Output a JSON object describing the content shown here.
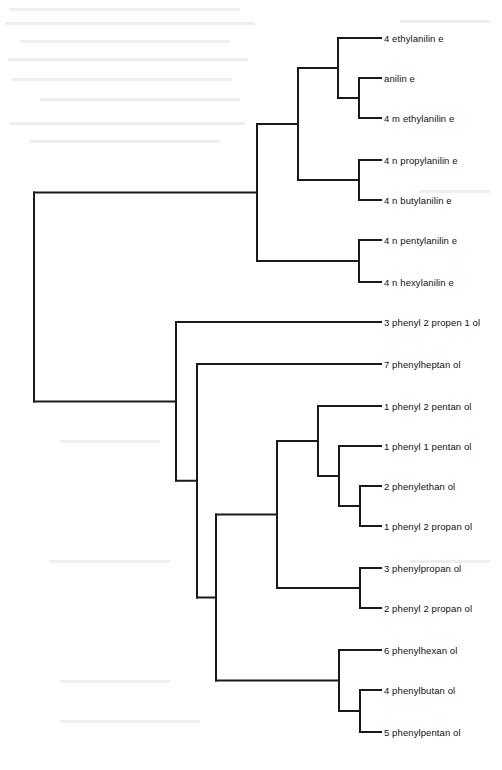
{
  "diagram": {
    "type": "dendrogram",
    "orientation": "left-to-right",
    "line_color": "#1a1a1a",
    "background": "#ffffff",
    "leaf_x_end": 381,
    "label_x": 384,
    "leaves": [
      {
        "id": "L0",
        "label": "4 ethylanilin e",
        "y": 38
      },
      {
        "id": "L1",
        "label": "anilin e",
        "y": 78
      },
      {
        "id": "L2",
        "label": "4 m ethylanilin e",
        "y": 118
      },
      {
        "id": "L3",
        "label": "4 n  propylanilin e",
        "y": 160
      },
      {
        "id": "L4",
        "label": "4 n  butylanilin e",
        "y": 200
      },
      {
        "id": "L5",
        "label": "4 n  pentylanilin e",
        "y": 240
      },
      {
        "id": "L6",
        "label": "4 n  hexylanilin e",
        "y": 282
      },
      {
        "id": "L7",
        "label": "3 phenyl 2 propen  1 ol",
        "y": 322
      },
      {
        "id": "L8",
        "label": "7 phenylheptan ol",
        "y": 364
      },
      {
        "id": "L9",
        "label": "1 phenyl 2 pentan ol",
        "y": 406
      },
      {
        "id": "L10",
        "label": "1 phenyl 1 pentan ol",
        "y": 446
      },
      {
        "id": "L11",
        "label": "2 phenylethan ol",
        "y": 486
      },
      {
        "id": "L12",
        "label": "1 phenyl 2 propan ol",
        "y": 526
      },
      {
        "id": "L13",
        "label": "3 phenylpropan ol",
        "y": 568
      },
      {
        "id": "L14",
        "label": "2 phenyl 2 propan ol",
        "y": 608
      },
      {
        "id": "L15",
        "label": "6 phenylhexan ol",
        "y": 650
      },
      {
        "id": "L16",
        "label": "4 phenylbutan ol",
        "y": 690
      },
      {
        "id": "L17",
        "label": "5 phenylpentan ol",
        "y": 732
      }
    ],
    "nodes": [
      {
        "id": "N_anil_methyl",
        "x": 359,
        "children": [
          "L1",
          "L2"
        ]
      },
      {
        "id": "N_ethyl_group",
        "x": 338,
        "children": [
          "L0",
          "N_anil_methyl"
        ]
      },
      {
        "id": "N_prop_but",
        "x": 359,
        "children": [
          "L3",
          "L4"
        ]
      },
      {
        "id": "N_aniline_top",
        "x": 298,
        "children": [
          "N_ethyl_group",
          "N_prop_but"
        ]
      },
      {
        "id": "N_pent_hex",
        "x": 359,
        "children": [
          "L5",
          "L6"
        ]
      },
      {
        "id": "N_anilines",
        "x": 257,
        "children": [
          "N_aniline_top",
          "N_pent_hex"
        ]
      },
      {
        "id": "N_eth_prop",
        "x": 360,
        "children": [
          "L11",
          "L12"
        ]
      },
      {
        "id": "N_1p1p",
        "x": 339,
        "children": [
          "L10",
          "N_eth_prop"
        ]
      },
      {
        "id": "N_1p2p",
        "x": 318,
        "children": [
          "L9",
          "N_1p1p"
        ]
      },
      {
        "id": "N_3pp_2p2p",
        "x": 360,
        "children": [
          "L13",
          "L14"
        ]
      },
      {
        "id": "N_mid",
        "x": 277,
        "children": [
          "N_1p2p",
          "N_3pp_2p2p"
        ]
      },
      {
        "id": "N_4pb_5pp",
        "x": 360,
        "children": [
          "L16",
          "L17"
        ]
      },
      {
        "id": "N_6ph",
        "x": 339,
        "children": [
          "L15",
          "N_4pb_5pp"
        ]
      },
      {
        "id": "N_low",
        "x": 216,
        "children": [
          "N_mid",
          "N_6ph"
        ]
      },
      {
        "id": "N_7ph",
        "x": 197,
        "children": [
          "L8",
          "N_low"
        ]
      },
      {
        "id": "N_alcohols",
        "x": 176,
        "children": [
          "L7",
          "N_7ph"
        ]
      },
      {
        "id": "root",
        "x": 34,
        "children": [
          "N_anilines",
          "N_alcohols"
        ]
      }
    ]
  }
}
